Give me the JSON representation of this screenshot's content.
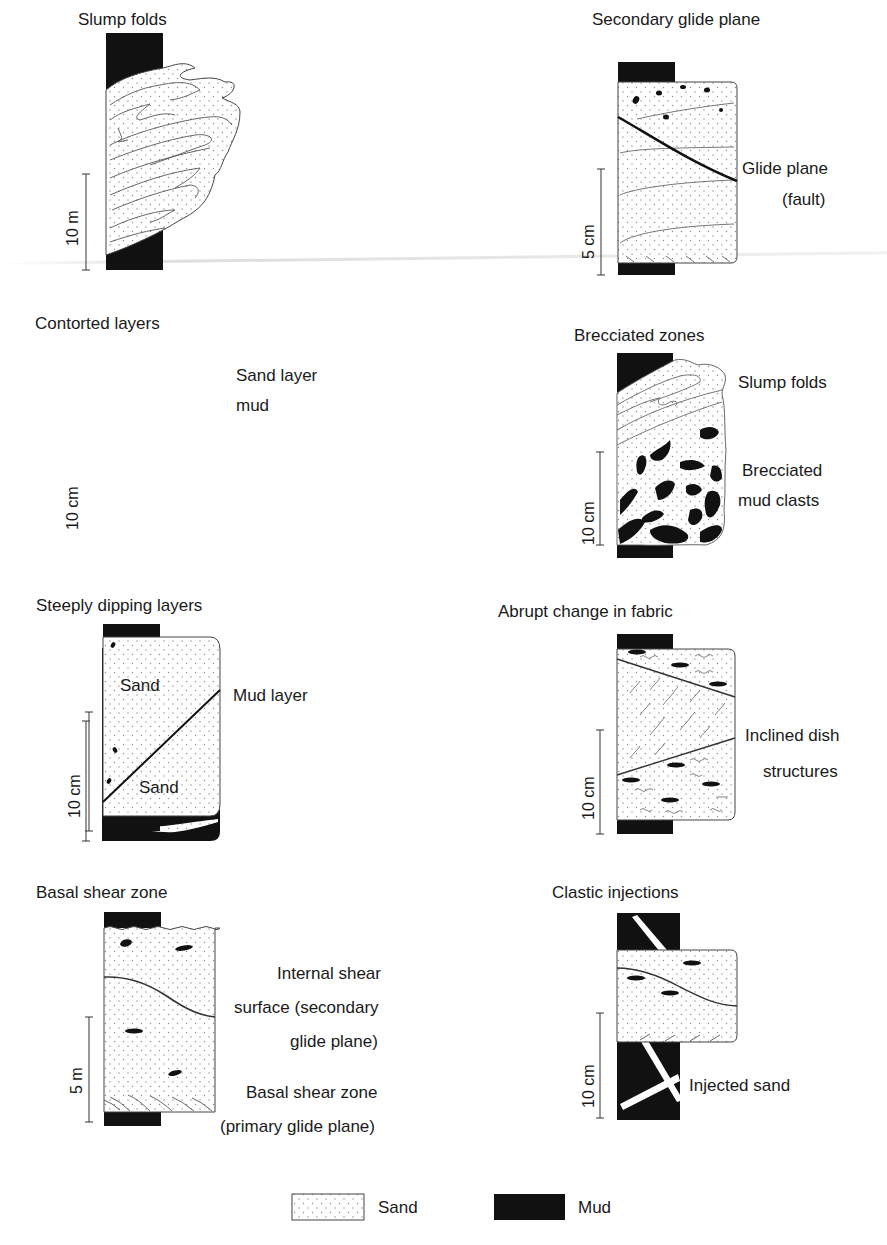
{
  "figure": {
    "panels": [
      {
        "id": "slump-folds",
        "title": "Slump folds",
        "scale": "10 m",
        "labels": []
      },
      {
        "id": "secondary-glide-plane",
        "title": "Secondary glide plane",
        "scale": "5 cm",
        "labels": [
          "Glide plane",
          "(fault)"
        ]
      },
      {
        "id": "contorted-layers",
        "title": "Contorted layers",
        "scale": "10 cm",
        "labels": [
          "Sand layer",
          "mud"
        ]
      },
      {
        "id": "brecciated-zones",
        "title": "Brecciated zones",
        "scale": "10 cm",
        "labels": [
          "Slump folds",
          "Brecciated",
          "mud clasts"
        ]
      },
      {
        "id": "steeply-dipping-layers",
        "title": "Steeply dipping layers",
        "scale": "10 cm",
        "labels": [
          "Sand",
          "Sand",
          "Mud layer"
        ]
      },
      {
        "id": "abrupt-change-in-fabric",
        "title": "Abrupt change in fabric",
        "scale": "10 cm",
        "labels": [
          "Inclined dish",
          "structures"
        ]
      },
      {
        "id": "basal-shear-zone",
        "title": "Basal shear zone",
        "scale": "5 m",
        "labels": [
          "Internal shear",
          "surface (secondary",
          "glide plane)",
          "Basal shear zone",
          "(primary glide plane)"
        ]
      },
      {
        "id": "clastic-injections",
        "title": "Clastic injections",
        "scale": "10 cm",
        "labels": [
          "Injected sand"
        ]
      }
    ],
    "legend": [
      {
        "label": "Sand",
        "pattern": "dotted",
        "color": "#ffffff"
      },
      {
        "label": "Mud",
        "pattern": "solid",
        "color": "#111111"
      }
    ]
  },
  "colors": {
    "mud": "#111111",
    "sand_fill": "#ffffff",
    "sand_dot": "#8a8a8a",
    "line": "#333333",
    "text": "#1a1a1a"
  }
}
